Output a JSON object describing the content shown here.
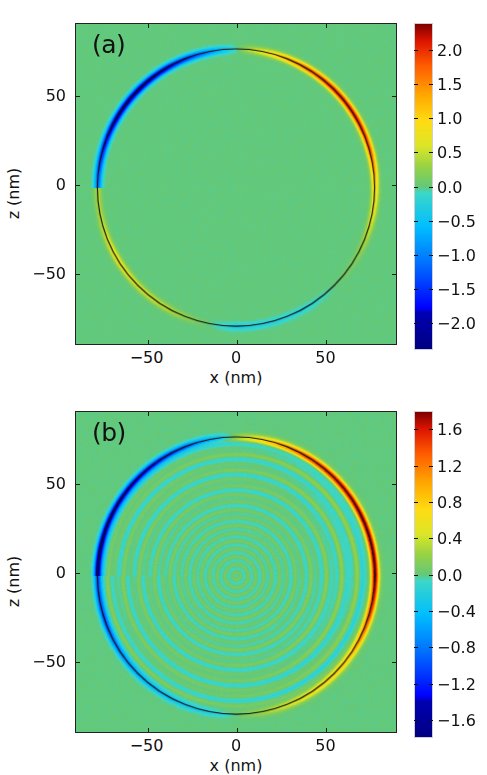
{
  "figure": {
    "width": 487,
    "height": 775,
    "background": "#ffffff"
  },
  "chart_data": [
    {
      "type": "heatmap",
      "panel_label": "(a)",
      "title": "",
      "xlabel": "x (nm)",
      "ylabel": "z (nm)",
      "xlim": [
        -90,
        90
      ],
      "ylim": [
        -90,
        90
      ],
      "xticks": [
        -50,
        0,
        50
      ],
      "xticklabels": [
        "−50",
        "0",
        "50"
      ],
      "yticks": [
        -50,
        0,
        50
      ],
      "yticklabels": [
        "−50",
        "0",
        "50"
      ],
      "grid": false,
      "colormap": "jet",
      "colorbar": {
        "vmin": -2.4,
        "vmax": 2.4,
        "ticks": [
          2.0,
          1.5,
          1.0,
          0.5,
          0.0,
          -0.5,
          -1.0,
          -1.5,
          -2.0
        ],
        "ticklabels": [
          "2.0",
          "1.5",
          "1.0",
          "0.5",
          "0.0",
          "−0.5",
          "−1.0",
          "−1.5",
          "−2.0"
        ],
        "position": "right",
        "label": ""
      },
      "feature": {
        "shape": "circle-outline",
        "center_nm": [
          0,
          -2
        ],
        "radius_nm": 78,
        "outline_color": "#111111",
        "background_value": 0.0,
        "description": "Dipolar contrast ring: negative (blue) on upper-left arc, positive (red) on upper-right arc, weak positive (yellow) on lower-left arc"
      },
      "annotations": [
        {
          "text": "−",
          "x_nm": -62,
          "z_nm": 60
        },
        {
          "text": "+",
          "x_nm": 66,
          "z_nm": 59
        },
        {
          "text": "+",
          "x_nm": -70,
          "z_nm": -55
        },
        {
          "text": "−",
          "x_nm": 62,
          "z_nm": -57
        }
      ],
      "ring_values": [
        {
          "angle_deg": 180,
          "value": -1.1
        },
        {
          "angle_deg": 165,
          "value": -1.6
        },
        {
          "angle_deg": 150,
          "value": -2.1
        },
        {
          "angle_deg": 135,
          "value": -2.2
        },
        {
          "angle_deg": 120,
          "value": -1.9
        },
        {
          "angle_deg": 105,
          "value": -1.2
        },
        {
          "angle_deg": 95,
          "value": -0.5
        },
        {
          "angle_deg": 85,
          "value": 0.4
        },
        {
          "angle_deg": 75,
          "value": 1.0
        },
        {
          "angle_deg": 60,
          "value": 1.8
        },
        {
          "angle_deg": 45,
          "value": 2.2
        },
        {
          "angle_deg": 30,
          "value": 2.2
        },
        {
          "angle_deg": 15,
          "value": 1.8
        },
        {
          "angle_deg": 0,
          "value": 1.0
        },
        {
          "angle_deg": -15,
          "value": 0.6
        },
        {
          "angle_deg": -30,
          "value": 0.2
        },
        {
          "angle_deg": -60,
          "value": -0.2
        },
        {
          "angle_deg": -90,
          "value": -0.3
        },
        {
          "angle_deg": -120,
          "value": 0.5
        },
        {
          "angle_deg": -150,
          "value": 0.8
        },
        {
          "angle_deg": -170,
          "value": 0.4
        }
      ]
    },
    {
      "type": "heatmap",
      "panel_label": "(b)",
      "title": "",
      "xlabel": "x (nm)",
      "ylabel": "z (nm)",
      "xlim": [
        -90,
        90
      ],
      "ylim": [
        -90,
        90
      ],
      "xticks": [
        -50,
        0,
        50
      ],
      "xticklabels": [
        "−50",
        "0",
        "50"
      ],
      "yticks": [
        -50,
        0,
        50
      ],
      "yticklabels": [
        "−50",
        "0",
        "50"
      ],
      "grid": false,
      "colormap": "jet",
      "colorbar": {
        "vmin": -1.8,
        "vmax": 1.8,
        "ticks": [
          1.6,
          1.2,
          0.8,
          0.4,
          0.0,
          -0.4,
          -0.8,
          -1.2,
          -1.6
        ],
        "ticklabels": [
          "1.6",
          "1.2",
          "0.8",
          "0.4",
          "0.0",
          "−0.4",
          "−0.8",
          "−1.2",
          "−1.6"
        ],
        "position": "right",
        "label": ""
      },
      "feature": {
        "shape": "circle-outline",
        "center_nm": [
          0,
          -2
        ],
        "radius_nm": 78,
        "outline_color": "#111111",
        "background_value": 0.0,
        "description": "Dipolar contrast ring with simulated interference fringes inside: strong negative (blue) on left arc, strong positive (red) on right arc"
      },
      "annotations": [
        {
          "text": "−",
          "x_nm": -60,
          "z_nm": 62
        },
        {
          "text": "+",
          "x_nm": 63,
          "z_nm": 59
        },
        {
          "text": "−",
          "x_nm": -88,
          "z_nm": 0
        },
        {
          "text": "+",
          "x_nm": 88,
          "z_nm": 0
        },
        {
          "text": "−",
          "x_nm": -60,
          "z_nm": -56
        },
        {
          "text": "+",
          "x_nm": 63,
          "z_nm": -56
        }
      ],
      "ring_values": [
        {
          "angle_deg": 180,
          "value": -1.7
        },
        {
          "angle_deg": 168,
          "value": -1.7
        },
        {
          "angle_deg": 155,
          "value": -1.6
        },
        {
          "angle_deg": 140,
          "value": -1.5
        },
        {
          "angle_deg": 125,
          "value": -1.3
        },
        {
          "angle_deg": 110,
          "value": -0.9
        },
        {
          "angle_deg": 98,
          "value": -0.4
        },
        {
          "angle_deg": 88,
          "value": 0.3
        },
        {
          "angle_deg": 75,
          "value": 0.9
        },
        {
          "angle_deg": 60,
          "value": 1.4
        },
        {
          "angle_deg": 45,
          "value": 1.6
        },
        {
          "angle_deg": 25,
          "value": 1.7
        },
        {
          "angle_deg": 10,
          "value": 1.7
        },
        {
          "angle_deg": 0,
          "value": 1.7
        },
        {
          "angle_deg": -15,
          "value": 1.4
        },
        {
          "angle_deg": -35,
          "value": 0.8
        },
        {
          "angle_deg": -55,
          "value": 0.6
        },
        {
          "angle_deg": -75,
          "value": 0.3
        },
        {
          "angle_deg": -100,
          "value": -0.2
        },
        {
          "angle_deg": -130,
          "value": -0.5
        },
        {
          "angle_deg": -160,
          "value": -1.0
        }
      ]
    }
  ]
}
